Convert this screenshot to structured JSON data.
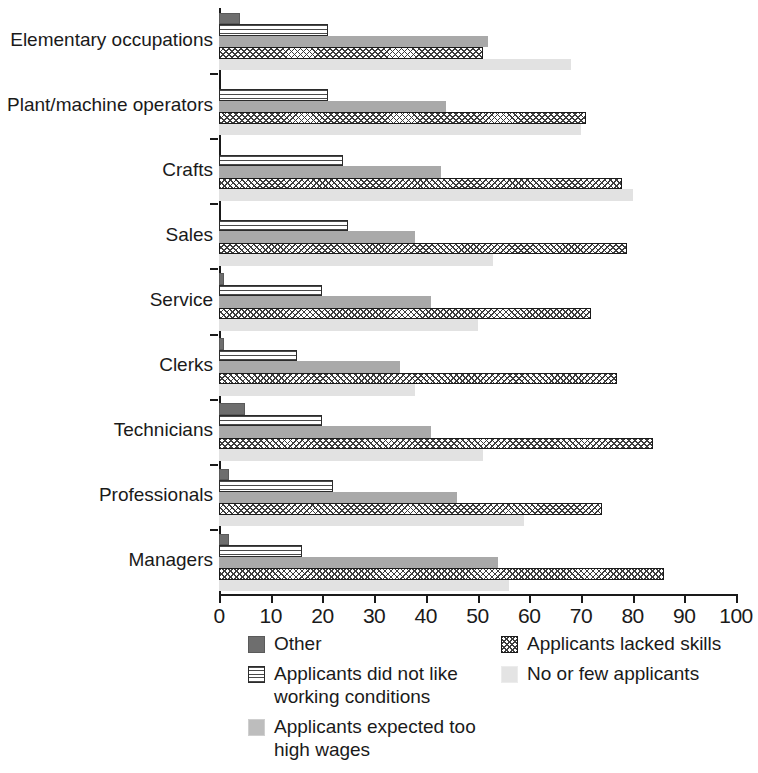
{
  "chart_data": {
    "type": "bar",
    "orientation": "horizontal",
    "title": "",
    "subtitle": "",
    "xlabel": "",
    "ylabel": "",
    "xlim": [
      0,
      100
    ],
    "xticks": [
      0,
      10,
      20,
      30,
      40,
      50,
      60,
      70,
      80,
      90,
      100
    ],
    "xtick_labels": [
      "0",
      "10",
      "20",
      "30",
      "40",
      "50",
      "60",
      "70",
      "80",
      "90",
      "100"
    ],
    "grid": false,
    "legend_position": "bottom",
    "categories": [
      "Elementary occupations",
      "Plant/machine operators",
      "Crafts",
      "Sales",
      "Service",
      "Clerks",
      "Technicians",
      "Professionals",
      "Managers"
    ],
    "series": [
      {
        "name": "Other",
        "color": "#6e6e6e",
        "pattern": "solid-dark-gray",
        "values": [
          4,
          0,
          0,
          0,
          1,
          1,
          5,
          2,
          2
        ]
      },
      {
        "name": "Applicants did not like working conditions",
        "color": "#ffffff",
        "pattern": "horizontal-stripes",
        "values": [
          21,
          21,
          24,
          25,
          20,
          15,
          20,
          22,
          16
        ]
      },
      {
        "name": "Applicants expected too high wages",
        "color": "#a9a9a9",
        "pattern": "solid-light-gray",
        "values": [
          52,
          44,
          43,
          38,
          41,
          35,
          41,
          46,
          54
        ]
      },
      {
        "name": "Applicants lacked skills",
        "color": "#ffffff",
        "pattern": "crosshatch",
        "values": [
          51,
          71,
          78,
          79,
          72,
          77,
          84,
          74,
          86
        ]
      },
      {
        "name": "No or few applicants",
        "color": "#e2e2e2",
        "pattern": "solid-very-light-gray",
        "values": [
          68,
          70,
          80,
          53,
          50,
          38,
          51,
          59,
          56
        ]
      }
    ]
  },
  "legend": {
    "left_column": [
      {
        "label": "Other",
        "swatch": "sw-other"
      },
      {
        "label": "Applicants did not like working conditions",
        "swatch": "sw-conditions"
      },
      {
        "label": "Applicants expected too high wages",
        "swatch": "sw-wages"
      }
    ],
    "right_column": [
      {
        "label": "Applicants lacked skills",
        "swatch": "sw-skills"
      },
      {
        "label": "No or few applicants",
        "swatch": "sw-noapp"
      }
    ]
  }
}
